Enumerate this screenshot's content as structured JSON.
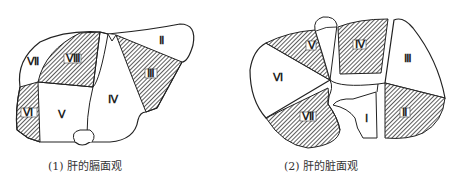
{
  "figures": [
    {
      "id": "diaphragmatic",
      "caption": "(1) 肝的膈面观",
      "segments": [
        {
          "label": "Ⅱ",
          "shaded": false
        },
        {
          "label": "Ⅲ",
          "shaded": true
        },
        {
          "label": "Ⅳ",
          "shaded": false
        },
        {
          "label": "Ⅴ",
          "shaded": false
        },
        {
          "label": "Ⅵ",
          "shaded": true
        },
        {
          "label": "Ⅶ",
          "shaded": false
        },
        {
          "label": "Ⅷ",
          "shaded": true
        }
      ]
    },
    {
      "id": "visceral",
      "caption": "(2) 肝的脏面观",
      "segments": [
        {
          "label": "Ⅰ",
          "shaded": false
        },
        {
          "label": "Ⅱ",
          "shaded": true
        },
        {
          "label": "Ⅲ",
          "shaded": false
        },
        {
          "label": "Ⅳ",
          "shaded": true
        },
        {
          "label": "Ⅴ",
          "shaded": true
        },
        {
          "label": "Ⅵ",
          "shaded": false
        },
        {
          "label": "Ⅶ",
          "shaded": true
        }
      ]
    }
  ],
  "colors": {
    "outline": "#222222",
    "hatch": "#333333",
    "background": "#ffffff"
  }
}
